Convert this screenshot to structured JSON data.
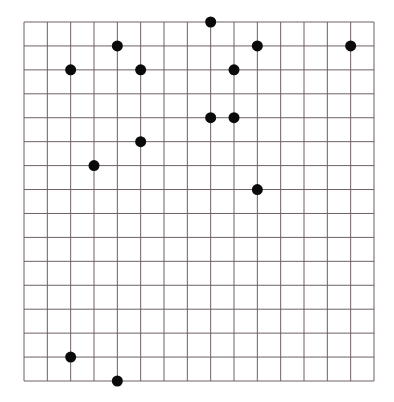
{
  "grid": {
    "cols": 15,
    "rows": 15,
    "left": 24,
    "top": 22,
    "right": 374,
    "bottom": 381,
    "line_color": "#6e5f66",
    "background": "#ffffff"
  },
  "dots": {
    "color": "#0a0a0a",
    "radius": 5.5,
    "points": [
      {
        "col": 8,
        "row": 0
      },
      {
        "col": 4,
        "row": 1
      },
      {
        "col": 10,
        "row": 1
      },
      {
        "col": 14,
        "row": 1
      },
      {
        "col": 2,
        "row": 2
      },
      {
        "col": 5,
        "row": 2
      },
      {
        "col": 9,
        "row": 2
      },
      {
        "col": 8,
        "row": 4
      },
      {
        "col": 9,
        "row": 4
      },
      {
        "col": 5,
        "row": 5
      },
      {
        "col": 3,
        "row": 6
      },
      {
        "col": 10,
        "row": 7
      },
      {
        "col": 2,
        "row": 14
      },
      {
        "col": 4,
        "row": 15
      }
    ]
  }
}
